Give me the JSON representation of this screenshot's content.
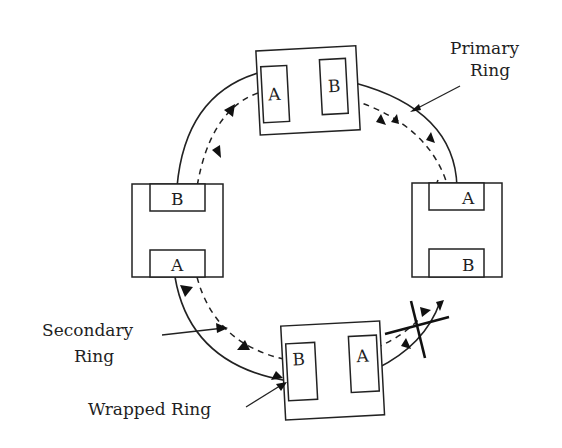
{
  "diagram": {
    "type": "dual-ring network (FDDI-style) with wrapped ring",
    "labels": {
      "primary": "Primary\nRing",
      "primary_line1": "Primary",
      "primary_line2": "Ring",
      "secondary_line1": "Secondary",
      "secondary_line2": "Ring",
      "wrapped": "Wrapped Ring"
    },
    "stations": [
      {
        "id": "top",
        "ports": [
          "A",
          "B"
        ]
      },
      {
        "id": "right",
        "ports": [
          "A",
          "B"
        ]
      },
      {
        "id": "bottom",
        "ports": [
          "B",
          "A"
        ]
      },
      {
        "id": "left",
        "ports": [
          "B",
          "A"
        ]
      }
    ],
    "break": {
      "location": "between right and bottom stations",
      "symbol": "cross"
    },
    "colors": {
      "line": "#222222",
      "background": "#ffffff"
    }
  }
}
